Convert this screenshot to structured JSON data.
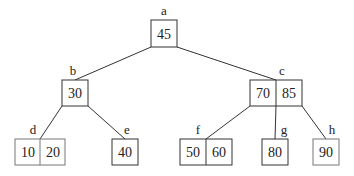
{
  "diagram": {
    "type": "b-tree",
    "nodes": [
      {
        "id": "a",
        "label": "a",
        "keys": [
          "45"
        ]
      },
      {
        "id": "b",
        "label": "b",
        "keys": [
          "30"
        ]
      },
      {
        "id": "c",
        "label": "c",
        "keys": [
          "70",
          "85"
        ]
      },
      {
        "id": "d",
        "label": "d",
        "keys": [
          "10",
          "20"
        ]
      },
      {
        "id": "e",
        "label": "e",
        "keys": [
          "40"
        ]
      },
      {
        "id": "f",
        "label": "f",
        "keys": [
          "50",
          "60"
        ]
      },
      {
        "id": "g",
        "label": "g",
        "keys": [
          "80"
        ]
      },
      {
        "id": "h",
        "label": "h",
        "keys": [
          "90"
        ]
      }
    ],
    "edges": [
      [
        "a",
        "b"
      ],
      [
        "a",
        "c"
      ],
      [
        "b",
        "d"
      ],
      [
        "b",
        "e"
      ],
      [
        "c",
        "f"
      ],
      [
        "c",
        "g"
      ],
      [
        "c",
        "h"
      ]
    ]
  }
}
